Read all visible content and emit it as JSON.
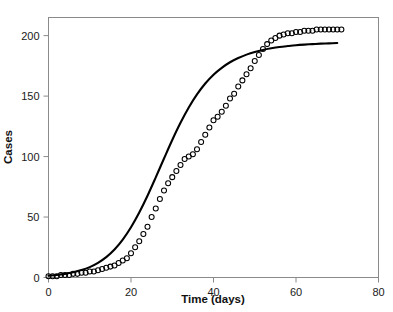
{
  "chart_data": {
    "type": "scatter",
    "title": "",
    "xlabel": "Time (days)",
    "ylabel": "Cases",
    "xlim": [
      0,
      80
    ],
    "ylim": [
      0,
      215
    ],
    "xticks": [
      0,
      20,
      40,
      60,
      80
    ],
    "yticks": [
      0,
      50,
      100,
      150,
      200
    ],
    "grid": false,
    "legend": null,
    "marker_style": "open-circle",
    "line_style": "solid",
    "series": [
      {
        "name": "Observed cases",
        "render": "markers",
        "x": [
          0,
          1,
          2,
          3,
          4,
          5,
          6,
          7,
          8,
          9,
          10,
          11,
          12,
          13,
          14,
          15,
          16,
          17,
          18,
          19,
          20,
          21,
          22,
          23,
          24,
          25,
          26,
          27,
          28,
          29,
          30,
          31,
          32,
          33,
          34,
          35,
          36,
          37,
          38,
          39,
          40,
          41,
          42,
          43,
          44,
          45,
          46,
          47,
          48,
          49,
          50,
          51,
          52,
          53,
          54,
          55,
          56,
          57,
          58,
          59,
          60,
          61,
          62,
          63,
          64,
          65,
          66,
          67,
          68,
          69,
          70,
          71
        ],
        "y": [
          1,
          1,
          1,
          2,
          2,
          2,
          3,
          3,
          4,
          4,
          5,
          5,
          6,
          7,
          8,
          9,
          10,
          12,
          14,
          16,
          20,
          25,
          30,
          36,
          42,
          50,
          57,
          65,
          72,
          78,
          83,
          88,
          93,
          98,
          100,
          102,
          106,
          112,
          118,
          124,
          130,
          133,
          137,
          142,
          148,
          152,
          158,
          163,
          168,
          173,
          179,
          184,
          189,
          193,
          196,
          198,
          200,
          201,
          202,
          202,
          203,
          203,
          204,
          204,
          204,
          205,
          205,
          205,
          205,
          205,
          205,
          205
        ]
      },
      {
        "name": "Fitted logistic model",
        "render": "line",
        "x": [
          0,
          2,
          4,
          6,
          8,
          10,
          12,
          14,
          16,
          18,
          20,
          22,
          24,
          26,
          28,
          30,
          32,
          34,
          36,
          38,
          40,
          42,
          44,
          46,
          48,
          50,
          52,
          54,
          56,
          58,
          60,
          62,
          64,
          66,
          68,
          70
        ],
        "y": [
          1.5,
          2.1,
          3.0,
          4.3,
          6.1,
          8.6,
          12.1,
          16.8,
          23.1,
          31.3,
          41.5,
          53.7,
          67.6,
          82.8,
          98.4,
          113.7,
          127.9,
          140.6,
          151.4,
          160.4,
          167.7,
          173.4,
          178.0,
          181.5,
          184.3,
          186.5,
          188.2,
          189.5,
          190.6,
          191.4,
          192.1,
          192.6,
          193.0,
          193.4,
          193.6,
          193.9
        ]
      }
    ]
  },
  "axes": {
    "x_tick_labels": [
      "0",
      "20",
      "40",
      "60",
      "80"
    ],
    "y_tick_labels": [
      "0",
      "50",
      "100",
      "150",
      "200"
    ],
    "x_axis_title": "Time (days)",
    "y_axis_title": "Cases"
  }
}
